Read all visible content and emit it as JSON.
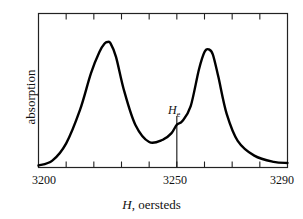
{
  "chart_data": {
    "type": "line",
    "title": "",
    "xlabel_var": "H",
    "xlabel_rest": ", oersteds",
    "xlabel": "H, oersteds",
    "ylabel": "absorption",
    "xlim": [
      3200,
      3290
    ],
    "x_ticks_major_labels": [
      "3200",
      "3250",
      "3290"
    ],
    "x_tick_values": [
      3200,
      3210,
      3220,
      3230,
      3240,
      3250,
      3260,
      3270,
      3280,
      3290
    ],
    "grid": false,
    "legend": null,
    "annotation": {
      "label": "H",
      "subscript": "e",
      "x": 3250
    },
    "series": [
      {
        "name": "absorption",
        "x": [
          3200,
          3205,
          3210,
          3215,
          3219,
          3222,
          3224,
          3225,
          3226,
          3228,
          3231,
          3235,
          3240,
          3245,
          3248,
          3250,
          3252,
          3255,
          3258,
          3260,
          3261.5,
          3263,
          3265,
          3268,
          3272,
          3278,
          3285,
          3290
        ],
        "y": [
          0.0,
          0.04,
          0.18,
          0.45,
          0.75,
          0.92,
          0.99,
          1.0,
          0.99,
          0.88,
          0.6,
          0.33,
          0.19,
          0.21,
          0.26,
          0.33,
          0.36,
          0.48,
          0.78,
          0.92,
          0.94,
          0.9,
          0.72,
          0.42,
          0.2,
          0.08,
          0.03,
          0.02
        ]
      }
    ]
  }
}
